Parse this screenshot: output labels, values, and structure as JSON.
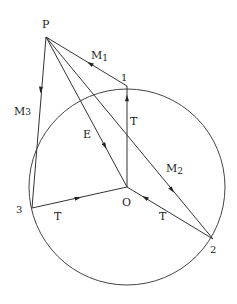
{
  "diagram": {
    "stroke_color": "#333333",
    "circle": {
      "cx": 127,
      "cy": 187,
      "r": 98
    },
    "points": {
      "P": {
        "x": 46,
        "y": 37,
        "label": "P"
      },
      "O": {
        "x": 127,
        "y": 187,
        "label": "O"
      },
      "one": {
        "x": 127,
        "y": 86,
        "label": "1"
      },
      "two": {
        "x": 213,
        "y": 239,
        "label": "2"
      },
      "three": {
        "x": 32,
        "y": 208,
        "label": "3"
      }
    },
    "edge_labels": {
      "M1": {
        "main": "M",
        "sub": "1"
      },
      "M2": {
        "main": "M",
        "sub": "2"
      },
      "M3": {
        "main": "M",
        "sub": "3"
      },
      "E": "E",
      "T_vertical": "T",
      "T_left": "T",
      "T_right": "T"
    }
  }
}
